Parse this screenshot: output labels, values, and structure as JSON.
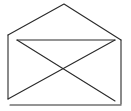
{
  "diagram": {
    "icon": "envelope-open-icon",
    "stroke_color": "#2a2a2a",
    "background_color": "#ffffff",
    "parts": [
      "envelope-flap",
      "envelope-body",
      "inner-flap-edge",
      "diagonal-fold-left",
      "diagonal-fold-right",
      "base-line"
    ]
  }
}
